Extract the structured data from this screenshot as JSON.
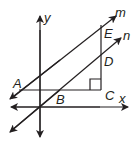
{
  "diagram": {
    "axes": {
      "x_label": "x",
      "y_label": "y"
    },
    "lines": [
      {
        "name": "m",
        "label": "m"
      },
      {
        "name": "n",
        "label": "n"
      }
    ],
    "points": [
      {
        "name": "A",
        "label": "A"
      },
      {
        "name": "B",
        "label": "B"
      },
      {
        "name": "C",
        "label": "C"
      },
      {
        "name": "D",
        "label": "D"
      },
      {
        "name": "E",
        "label": "E"
      }
    ],
    "right_angle_at": "C",
    "colors": {
      "stroke": "#231f20",
      "background": "#ffffff"
    }
  }
}
